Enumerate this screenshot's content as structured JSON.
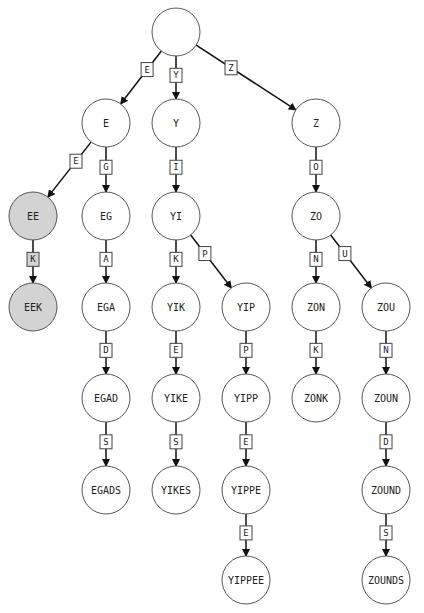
{
  "diagram": {
    "type": "trie",
    "root": "",
    "highlight_fill": "#d3d3d3",
    "node_fill": "#ffffff",
    "node_radius": 24,
    "nodes": [
      {
        "id": "root",
        "label": "",
        "x": 176,
        "y": 32,
        "highlighted": false
      },
      {
        "id": "E",
        "label": "E",
        "x": 106,
        "y": 123,
        "highlighted": false
      },
      {
        "id": "Y",
        "label": "Y",
        "x": 176,
        "y": 123,
        "highlighted": false
      },
      {
        "id": "Z",
        "label": "Z",
        "x": 316,
        "y": 123,
        "highlighted": false
      },
      {
        "id": "EE",
        "label": "EE",
        "x": 33,
        "y": 216,
        "highlighted": true
      },
      {
        "id": "EG",
        "label": "EG",
        "x": 106,
        "y": 216,
        "highlighted": false
      },
      {
        "id": "YI",
        "label": "YI",
        "x": 176,
        "y": 216,
        "highlighted": false
      },
      {
        "id": "ZO",
        "label": "ZO",
        "x": 316,
        "y": 216,
        "highlighted": false
      },
      {
        "id": "EEK",
        "label": "EEK",
        "x": 33,
        "y": 307,
        "highlighted": true
      },
      {
        "id": "EGA",
        "label": "EGA",
        "x": 106,
        "y": 307,
        "highlighted": false
      },
      {
        "id": "YIK",
        "label": "YIK",
        "x": 176,
        "y": 307,
        "highlighted": false
      },
      {
        "id": "YIP",
        "label": "YIP",
        "x": 246,
        "y": 307,
        "highlighted": false
      },
      {
        "id": "ZON",
        "label": "ZON",
        "x": 316,
        "y": 307,
        "highlighted": false
      },
      {
        "id": "ZOU",
        "label": "ZOU",
        "x": 386,
        "y": 307,
        "highlighted": false
      },
      {
        "id": "EGAD",
        "label": "EGAD",
        "x": 106,
        "y": 398,
        "highlighted": false
      },
      {
        "id": "YIKE",
        "label": "YIKE",
        "x": 176,
        "y": 398,
        "highlighted": false
      },
      {
        "id": "YIPP",
        "label": "YIPP",
        "x": 246,
        "y": 398,
        "highlighted": false
      },
      {
        "id": "ZONK",
        "label": "ZONK",
        "x": 316,
        "y": 398,
        "highlighted": false
      },
      {
        "id": "ZOUN",
        "label": "ZOUN",
        "x": 386,
        "y": 398,
        "highlighted": false
      },
      {
        "id": "EGADS",
        "label": "EGADS",
        "x": 106,
        "y": 490,
        "highlighted": false
      },
      {
        "id": "YIKES",
        "label": "YIKES",
        "x": 176,
        "y": 490,
        "highlighted": false
      },
      {
        "id": "YIPPE",
        "label": "YIPPE",
        "x": 246,
        "y": 490,
        "highlighted": false
      },
      {
        "id": "ZOUND",
        "label": "ZOUND",
        "x": 386,
        "y": 490,
        "highlighted": false
      },
      {
        "id": "YIPPEE",
        "label": "YIPPEE",
        "x": 246,
        "y": 580,
        "highlighted": false
      },
      {
        "id": "ZOUNDS",
        "label": "ZOUNDS",
        "x": 386,
        "y": 580,
        "highlighted": false
      }
    ],
    "edges": [
      {
        "from": "root",
        "to": "E",
        "label": "E",
        "highlighted": false
      },
      {
        "from": "root",
        "to": "Y",
        "label": "Y",
        "highlighted": false
      },
      {
        "from": "root",
        "to": "Z",
        "label": "Z",
        "highlighted": false
      },
      {
        "from": "E",
        "to": "EE",
        "label": "E",
        "highlighted": false
      },
      {
        "from": "E",
        "to": "EG",
        "label": "G",
        "highlighted": false
      },
      {
        "from": "Y",
        "to": "YI",
        "label": "I",
        "highlighted": false
      },
      {
        "from": "Z",
        "to": "ZO",
        "label": "O",
        "highlighted": false
      },
      {
        "from": "EE",
        "to": "EEK",
        "label": "K",
        "highlighted": true
      },
      {
        "from": "EG",
        "to": "EGA",
        "label": "A",
        "highlighted": false
      },
      {
        "from": "YI",
        "to": "YIK",
        "label": "K",
        "highlighted": false
      },
      {
        "from": "YI",
        "to": "YIP",
        "label": "P",
        "highlighted": false
      },
      {
        "from": "ZO",
        "to": "ZON",
        "label": "N",
        "highlighted": false
      },
      {
        "from": "ZO",
        "to": "ZOU",
        "label": "U",
        "highlighted": false
      },
      {
        "from": "EGA",
        "to": "EGAD",
        "label": "D",
        "highlighted": false
      },
      {
        "from": "YIK",
        "to": "YIKE",
        "label": "E",
        "highlighted": false
      },
      {
        "from": "YIP",
        "to": "YIPP",
        "label": "P",
        "highlighted": false
      },
      {
        "from": "ZON",
        "to": "ZONK",
        "label": "K",
        "highlighted": false
      },
      {
        "from": "ZOU",
        "to": "ZOUN",
        "label": "N",
        "highlighted": false
      },
      {
        "from": "EGAD",
        "to": "EGADS",
        "label": "S",
        "highlighted": false
      },
      {
        "from": "YIKE",
        "to": "YIKES",
        "label": "S",
        "highlighted": false
      },
      {
        "from": "YIPP",
        "to": "YIPPE",
        "label": "E",
        "highlighted": false
      },
      {
        "from": "ZOUN",
        "to": "ZOUND",
        "label": "D",
        "highlighted": false
      },
      {
        "from": "YIPPE",
        "to": "YIPPEE",
        "label": "E",
        "highlighted": false
      },
      {
        "from": "ZOUND",
        "to": "ZOUNDS",
        "label": "S",
        "highlighted": false
      }
    ]
  }
}
